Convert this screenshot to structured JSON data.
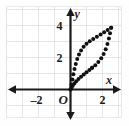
{
  "figure": {
    "name": "coordinate-plane-dotted-loop",
    "background_color": "#ffffff",
    "grid_color": "#e4e4e8",
    "frame_color": "#e9e9ec",
    "axis_color": "#1a1a1a",
    "dot_color": "#111111"
  },
  "axes": {
    "x_label": "x",
    "y_label": "y",
    "origin_label": "O",
    "x_ticks": [
      {
        "label": "–2",
        "value": -2
      },
      {
        "label": "2",
        "value": 2
      }
    ],
    "y_ticks": [
      {
        "label": "2",
        "value": 2
      },
      {
        "label": "4",
        "value": 4
      }
    ],
    "x_range": [
      -3.4,
      3.4
    ],
    "y_range": [
      -1.4,
      5.2
    ],
    "x_arrows": [
      "left",
      "right"
    ],
    "y_arrows": [
      "up",
      "down"
    ]
  },
  "chart_data": {
    "type": "scatter",
    "title": "",
    "xlabel": "x",
    "ylabel": "y",
    "xlim": [
      -3.4,
      3.4
    ],
    "ylim": [
      -1.4,
      5.2
    ],
    "grid": true,
    "legend": null,
    "series": [
      {
        "name": "upper-branch",
        "marker": "dot",
        "points": [
          [
            0.0,
            0.0
          ],
          [
            0.06,
            0.3
          ],
          [
            0.12,
            0.62
          ],
          [
            0.18,
            0.95
          ],
          [
            0.25,
            1.28
          ],
          [
            0.33,
            1.6
          ],
          [
            0.42,
            1.9
          ],
          [
            0.53,
            2.18
          ],
          [
            0.66,
            2.44
          ],
          [
            0.82,
            2.67
          ],
          [
            1.0,
            2.86
          ],
          [
            1.2,
            3.02
          ],
          [
            1.42,
            3.16
          ],
          [
            1.65,
            3.3
          ],
          [
            1.88,
            3.44
          ],
          [
            2.1,
            3.58
          ],
          [
            2.32,
            3.72
          ],
          [
            2.54,
            3.86
          ]
        ]
      },
      {
        "name": "right-branch",
        "marker": "dot",
        "points": [
          [
            2.54,
            3.86
          ],
          [
            2.47,
            3.52
          ],
          [
            2.4,
            3.18
          ],
          [
            2.31,
            2.84
          ],
          [
            2.2,
            2.52
          ],
          [
            2.07,
            2.22
          ],
          [
            1.92,
            1.95
          ],
          [
            1.74,
            1.72
          ],
          [
            1.55,
            1.52
          ],
          [
            1.35,
            1.36
          ]
        ]
      },
      {
        "name": "lower-branch",
        "marker": "dot",
        "points": [
          [
            1.35,
            1.36
          ],
          [
            1.18,
            1.22
          ],
          [
            1.0,
            1.08
          ],
          [
            0.83,
            0.94
          ],
          [
            0.66,
            0.8
          ],
          [
            0.5,
            0.66
          ],
          [
            0.36,
            0.52
          ],
          [
            0.24,
            0.38
          ],
          [
            0.14,
            0.24
          ],
          [
            0.06,
            0.11
          ],
          [
            0.0,
            0.0
          ]
        ]
      }
    ]
  }
}
